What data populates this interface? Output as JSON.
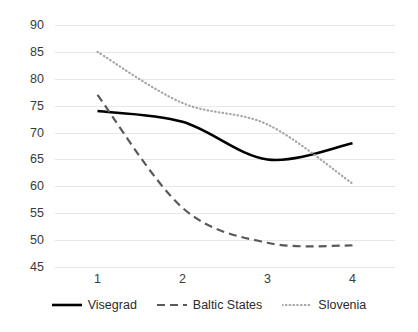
{
  "chart_data": {
    "type": "line",
    "title": "",
    "xlabel": "",
    "ylabel": "",
    "categories": [
      "1",
      "2",
      "3",
      "4"
    ],
    "ylim": [
      45,
      90
    ],
    "ytick_labels": [
      "90",
      "85",
      "80",
      "75",
      "70",
      "65",
      "60",
      "55",
      "50",
      "45"
    ],
    "ytick_values": [
      90,
      85,
      80,
      75,
      70,
      65,
      60,
      55,
      50,
      45
    ],
    "grid": true,
    "smoothed": true,
    "legend_position": "bottom",
    "series": [
      {
        "name": "Visegrad",
        "values": [
          74,
          72,
          65,
          68
        ],
        "color": "#000000",
        "style": "solid"
      },
      {
        "name": "Baltic States",
        "values": [
          77,
          56,
          49.5,
          49
        ],
        "color": "#595959",
        "style": "dashed"
      },
      {
        "name": "Slovenia",
        "values": [
          85,
          75.5,
          71.5,
          60.5
        ],
        "color": "#a6a6a6",
        "style": "dotted"
      }
    ]
  },
  "legend": {
    "items": [
      {
        "label": "Visegrad"
      },
      {
        "label": "Baltic States"
      },
      {
        "label": "Slovenia"
      }
    ]
  },
  "colors": {
    "gridline": "#e8e8e8",
    "axis_text": "#3a3a3a",
    "background": "#ffffff"
  }
}
